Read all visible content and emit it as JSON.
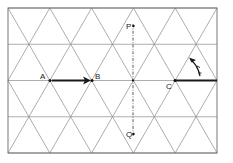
{
  "diagram": {
    "type": "triangular-lattice",
    "colors": {
      "grid": "#8a8a8a",
      "frame": "#6a6a6a",
      "ink": "#1a1a1a"
    },
    "labels": {
      "A": "A",
      "B": "B",
      "C": "C",
      "P": "P",
      "Q": "Q"
    },
    "frame": {
      "x0": 8,
      "y0": 8,
      "x1": 217,
      "y1": 153
    },
    "rows_y": [
      8,
      44.25,
      80.5,
      116.75,
      153
    ],
    "col_spacing": 41.8,
    "points": {
      "A": {
        "x": 50,
        "y": 80.5
      },
      "B": {
        "x": 92,
        "y": 80.5
      },
      "C": {
        "x": 175,
        "y": 80.5
      },
      "P": {
        "x": 133,
        "y": 26
      },
      "Q": {
        "x": 133,
        "y": 134
      },
      "center": {
        "x": 133,
        "y": 80.5
      }
    },
    "vectors": [
      {
        "name": "AB",
        "from": "A",
        "to": "B",
        "arrow": true
      },
      {
        "name": "C-right",
        "from": "C",
        "to_x": 217,
        "arrow": false
      }
    ],
    "rotation_arrow": {
      "about": "C",
      "direction": "counterclockwise",
      "angle_deg": 60
    },
    "axis": {
      "name": "PQ",
      "style": "dash-dot",
      "x": 133,
      "y_from": 24,
      "y_to": 136
    }
  }
}
